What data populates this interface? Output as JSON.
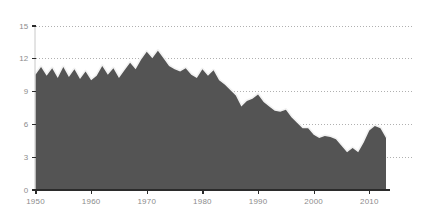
{
  "chart_data": {
    "type": "area",
    "title": "",
    "subtitle": "",
    "xlabel": "",
    "ylabel": "",
    "xlim": [
      1950,
      2013
    ],
    "ylim": [
      0,
      15
    ],
    "grid": true,
    "legend": null,
    "colors": {
      "area_fill": "#545454",
      "area_halo": "#f2f2f2",
      "gridline": "#b0b0b0",
      "axis": "#2b2b2b",
      "tick_text": "#8c8c8c",
      "background": "#ffffff"
    },
    "y_ticks": [
      0,
      3,
      6,
      9,
      12,
      15
    ],
    "y_tick_labels": [
      "0",
      "3",
      "6",
      "9",
      "12",
      "15"
    ],
    "x_ticks": [
      1950,
      1960,
      1970,
      1980,
      1990,
      2000,
      2010
    ],
    "x_tick_labels": [
      "1950",
      "1960",
      "1970",
      "1980",
      "1990",
      "2000",
      "2010"
    ],
    "x": [
      1950,
      1951,
      1952,
      1953,
      1954,
      1955,
      1956,
      1957,
      1958,
      1959,
      1960,
      1961,
      1962,
      1963,
      1964,
      1965,
      1966,
      1967,
      1968,
      1969,
      1970,
      1971,
      1972,
      1973,
      1974,
      1975,
      1976,
      1977,
      1978,
      1979,
      1980,
      1981,
      1982,
      1983,
      1984,
      1985,
      1986,
      1987,
      1988,
      1989,
      1990,
      1991,
      1992,
      1993,
      1994,
      1995,
      1996,
      1997,
      1998,
      1999,
      2000,
      2001,
      2002,
      2003,
      2004,
      2005,
      2006,
      2007,
      2008,
      2009,
      2010,
      2011,
      2012,
      2013
    ],
    "values": [
      10.5,
      11.2,
      10.4,
      11.1,
      10.2,
      11.2,
      10.3,
      11.0,
      10.1,
      10.8,
      10.0,
      10.4,
      11.3,
      10.5,
      11.1,
      10.2,
      10.9,
      11.6,
      11.0,
      11.9,
      12.6,
      12.0,
      12.7,
      12.0,
      11.3,
      11.0,
      10.8,
      11.1,
      10.5,
      10.2,
      11.0,
      10.4,
      10.9,
      10.0,
      9.6,
      9.1,
      8.6,
      7.6,
      8.1,
      8.3,
      8.7,
      8.0,
      7.6,
      7.2,
      7.1,
      7.3,
      6.6,
      6.1,
      5.6,
      5.6,
      5.0,
      4.7,
      4.9,
      4.8,
      4.6,
      4.0,
      3.4,
      3.8,
      3.4,
      4.3,
      5.4,
      5.8,
      5.6,
      4.7
    ],
    "series": [
      {
        "name": "series-1",
        "values": [
          10.5,
          11.2,
          10.4,
          11.1,
          10.2,
          11.2,
          10.3,
          11.0,
          10.1,
          10.8,
          10.0,
          10.4,
          11.3,
          10.5,
          11.1,
          10.2,
          10.9,
          11.6,
          11.0,
          11.9,
          12.6,
          12.0,
          12.7,
          12.0,
          11.3,
          11.0,
          10.8,
          11.1,
          10.5,
          10.2,
          11.0,
          10.4,
          10.9,
          10.0,
          9.6,
          9.1,
          8.6,
          7.6,
          8.1,
          8.3,
          8.7,
          8.0,
          7.6,
          7.2,
          7.1,
          7.3,
          6.6,
          6.1,
          5.6,
          5.6,
          5.0,
          4.7,
          4.9,
          4.8,
          4.6,
          4.0,
          3.4,
          3.8,
          3.4,
          4.3,
          5.4,
          5.8,
          5.6,
          4.7
        ]
      }
    ]
  }
}
